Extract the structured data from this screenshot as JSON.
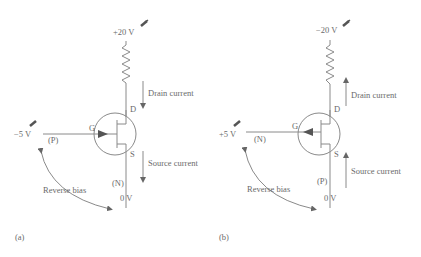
{
  "diagram": {
    "colors": {
      "line": "#8a8a8a",
      "text": "#6a6a6a",
      "arrowhead": "#555555",
      "background": "#ffffff"
    },
    "panels": [
      {
        "id": "a",
        "caption": "(a)",
        "supply_voltage": "+20 V",
        "gate_voltage": "−5 V",
        "gate_region": "(P)",
        "channel_region": "(N)",
        "ground_voltage": "0 V",
        "terminals": {
          "gate": "G",
          "drain": "D",
          "source": "S"
        },
        "drain_current_label": "Drain current",
        "drain_current_direction": "down",
        "source_current_label": "Source current",
        "source_current_direction": "down",
        "gate_arrow_direction": "inward",
        "bias_label": "Reverse bias"
      },
      {
        "id": "b",
        "caption": "(b)",
        "supply_voltage": "−20 V",
        "gate_voltage": "+5 V",
        "gate_region": "(N)",
        "channel_region": "(P)",
        "ground_voltage": "0 V",
        "terminals": {
          "gate": "G",
          "drain": "D",
          "source": "S"
        },
        "drain_current_label": "Drain current",
        "drain_current_direction": "up",
        "source_current_label": "Source current",
        "source_current_direction": "up",
        "gate_arrow_direction": "outward",
        "bias_label": "Reverse bias"
      }
    ]
  }
}
